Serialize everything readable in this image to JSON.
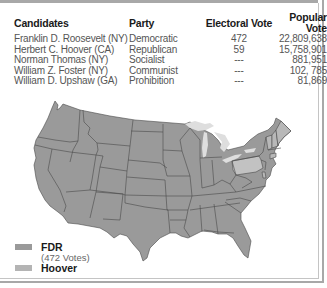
{
  "table": {
    "headers": {
      "candidates": "Candidates",
      "party": "Party",
      "electoral_vote": "Electoral Vote",
      "popular_vote": "Popular Vote"
    },
    "rows": [
      {
        "candidate": "Franklin D. Roosevelt (NY)",
        "party": "Democratic",
        "electoral_vote": "472",
        "popular_vote": "22,809,638"
      },
      {
        "candidate": "Herbert C. Hoover (CA)",
        "party": "Republican",
        "electoral_vote": "59",
        "popular_vote": "15,758,901"
      },
      {
        "candidate": "Norman Thomas (NY)",
        "party": "Socialist",
        "electoral_vote": "---",
        "popular_vote": "881,951"
      },
      {
        "candidate": "William Z. Foster (NY)",
        "party": "Communist",
        "electoral_vote": "---",
        "popular_vote": "102, 785"
      },
      {
        "candidate": "William D. Upshaw (GA)",
        "party": "Prohibition",
        "electoral_vote": "---",
        "popular_vote": "81,869"
      }
    ]
  },
  "map": {
    "colors": {
      "fdr": "#9a9a9a",
      "hoover": "#c2c2c2",
      "lakes": "#dedede",
      "border": "#4a4a4a"
    },
    "hoover_states": [
      "Pennsylvania",
      "Maine",
      "Vermont",
      "New Hampshire",
      "Connecticut",
      "Delaware"
    ]
  },
  "legend": {
    "items": [
      {
        "label": "FDR",
        "sublabel": "(472 Votes)",
        "color": "#9a9a9a"
      },
      {
        "label": "Hoover",
        "color": "#b4b4b4"
      }
    ]
  }
}
